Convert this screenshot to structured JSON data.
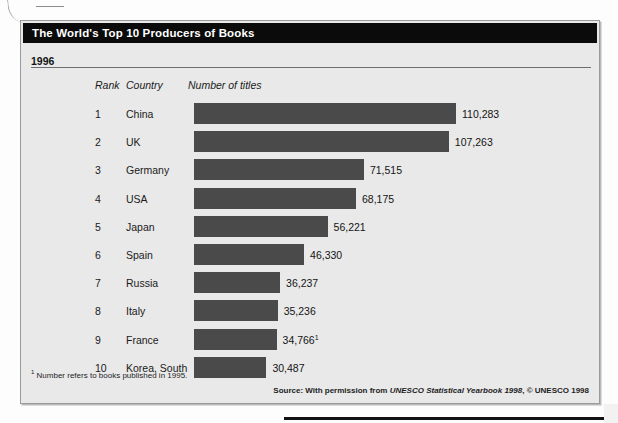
{
  "figure": {
    "title": "The World's Top 10 Producers of Books",
    "year": "1996",
    "footnote_marker": "1",
    "footnote_text": "Number refers to books published in 1995.",
    "source_prefix": "Source: With permission from ",
    "source_italic": "UNESCO Statistical Yearbook 1998",
    "source_suffix": ", © UNESCO 1998"
  },
  "columns": {
    "rank": "Rank",
    "country": "Country",
    "titles": "Number of titles"
  },
  "colors": {
    "bar": "#4a4a4a",
    "panel_background": "#e9e9e9",
    "title_bar": "#0b0b0b",
    "title_text": "#ffffff",
    "rule": "#6e6e6e",
    "panel_border": "#9a9a9a"
  },
  "chart_data": {
    "type": "bar",
    "title": "The World's Top 10 Producers of Books",
    "subtitle": "1996",
    "orientation": "horizontal",
    "xlabel": "Number of titles",
    "ylabel": "Country",
    "grid": false,
    "legend": "none",
    "xlim": [
      0,
      110283
    ],
    "categories": [
      "China",
      "UK",
      "Germany",
      "USA",
      "Japan",
      "Spain",
      "Russia",
      "Italy",
      "France",
      "Korea, South"
    ],
    "values": [
      110283,
      107263,
      71515,
      68175,
      56221,
      46330,
      36237,
      35236,
      34766,
      30487
    ],
    "value_labels": [
      "110,283",
      "107,263",
      "71,515",
      "68,175",
      "56,221",
      "46,330",
      "36,237",
      "35,236",
      "34,766",
      "30,487"
    ],
    "ranks": [
      "1",
      "2",
      "3",
      "4",
      "5",
      "6",
      "7",
      "8",
      "9",
      "10"
    ],
    "footnote_refs": [
      null,
      null,
      null,
      null,
      null,
      null,
      null,
      null,
      "1",
      null
    ],
    "annotations": [
      "1 Number refers to books published in 1995.",
      "Source: With permission from UNESCO Statistical Yearbook 1998, © UNESCO 1998"
    ]
  },
  "rows": [
    {
      "rank": "1",
      "country": "China",
      "value_label": "110,283",
      "note": ""
    },
    {
      "rank": "2",
      "country": "UK",
      "value_label": "107,263",
      "note": ""
    },
    {
      "rank": "3",
      "country": "Germany",
      "value_label": "71,515",
      "note": ""
    },
    {
      "rank": "4",
      "country": "USA",
      "value_label": "68,175",
      "note": ""
    },
    {
      "rank": "5",
      "country": "Japan",
      "value_label": "56,221",
      "note": ""
    },
    {
      "rank": "6",
      "country": "Spain",
      "value_label": "46,330",
      "note": ""
    },
    {
      "rank": "7",
      "country": "Russia",
      "value_label": "36,237",
      "note": ""
    },
    {
      "rank": "8",
      "country": "Italy",
      "value_label": "35,236",
      "note": ""
    },
    {
      "rank": "9",
      "country": "France",
      "value_label": "34,766",
      "note": "1"
    },
    {
      "rank": "10",
      "country": "Korea, South",
      "value_label": "30,487",
      "note": ""
    }
  ]
}
